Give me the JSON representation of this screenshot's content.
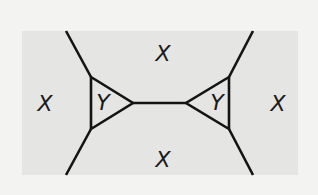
{
  "diagram": {
    "type": "graph-with-regions",
    "colors": {
      "background": "#f3f3f1",
      "region": "#e5e5e3",
      "stroke": "#141414",
      "label": "#1a1a1a"
    },
    "region_labels": {
      "top": "X",
      "bottom": "X",
      "left": "X",
      "right": "X",
      "left_triangle": "Y",
      "right_triangle": "Y"
    },
    "labels": [
      {
        "id": "top",
        "text": "X",
        "x": 163,
        "y": 61
      },
      {
        "id": "bottom",
        "text": "X",
        "x": 163,
        "y": 167
      },
      {
        "id": "left",
        "text": "X",
        "x": 45,
        "y": 111
      },
      {
        "id": "right",
        "text": "X",
        "x": 278,
        "y": 111
      },
      {
        "id": "left-triangle",
        "text": "Y",
        "x": 102,
        "y": 110
      },
      {
        "id": "right-triangle",
        "text": "Y",
        "x": 217,
        "y": 110
      }
    ],
    "vertices": {
      "left_tri_top": [
        91,
        77
      ],
      "left_tri_bottom": [
        91,
        129
      ],
      "left_tri_apex": [
        133,
        103
      ],
      "right_tri_apex": [
        186,
        103
      ],
      "right_tri_top": [
        229,
        77
      ],
      "right_tri_bottom": [
        229,
        129
      ]
    },
    "edges": [
      {
        "from": [
          66,
          31
        ],
        "to": [
          91,
          77
        ]
      },
      {
        "from": [
          66,
          175
        ],
        "to": [
          91,
          129
        ]
      },
      {
        "from": [
          253,
          31
        ],
        "to": [
          229,
          77
        ]
      },
      {
        "from": [
          253,
          175
        ],
        "to": [
          229,
          129
        ]
      },
      {
        "from": [
          133,
          103
        ],
        "to": [
          186,
          103
        ]
      }
    ],
    "region_rect": {
      "x": 22,
      "y": 31,
      "width": 276,
      "height": 144
    }
  }
}
